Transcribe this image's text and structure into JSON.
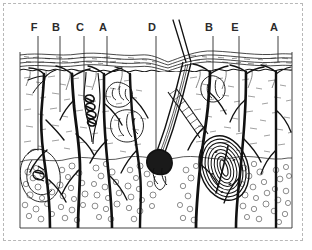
{
  "figure": {
    "frame_style": "dashed",
    "frame_color": "#b8b8b8",
    "ink_color": "#1a1a1a",
    "background_color": "#ffffff"
  },
  "labels": [
    {
      "id": "label-f-left",
      "text": "F",
      "x": 34,
      "y": 30,
      "leader_x": 38,
      "leader_top": 36,
      "leader_bottom": 150
    },
    {
      "id": "label-b-left",
      "text": "B",
      "x": 56,
      "y": 30,
      "leader_x": 60,
      "leader_top": 36,
      "leader_bottom": 112
    },
    {
      "id": "label-c-left",
      "text": "C",
      "x": 80,
      "y": 30,
      "leader_x": 84,
      "leader_top": 36,
      "leader_bottom": 100
    },
    {
      "id": "label-a-left",
      "text": "A",
      "x": 103,
      "y": 30,
      "leader_x": 107,
      "leader_top": 36,
      "leader_bottom": 66
    },
    {
      "id": "label-d-mid",
      "text": "D",
      "x": 152,
      "y": 30,
      "leader_x": 156,
      "leader_top": 36,
      "leader_bottom": 150
    },
    {
      "id": "label-b-right",
      "text": "B",
      "x": 209,
      "y": 30,
      "leader_x": 213,
      "leader_top": 36,
      "leader_bottom": 70
    },
    {
      "id": "label-e-right",
      "text": "E",
      "x": 235,
      "y": 30,
      "leader_x": 239,
      "leader_top": 36,
      "leader_bottom": 132
    },
    {
      "id": "label-a-right",
      "text": "A",
      "x": 274,
      "y": 30,
      "leader_x": 278,
      "leader_top": 36,
      "leader_bottom": 62
    }
  ],
  "layers": [
    {
      "name": "epidermis",
      "top": 52,
      "bottom": 70
    },
    {
      "name": "dermis",
      "top": 70,
      "bottom": 158
    },
    {
      "name": "hypodermis",
      "top": 158,
      "bottom": 228
    }
  ],
  "structures": [
    {
      "name": "hair-shaft",
      "description": "two parallel oblique lines rising above skin surface"
    },
    {
      "name": "hair-follicle",
      "description": "deep oblique follicle with dark root bulb"
    },
    {
      "name": "arrector-pili",
      "description": "hatched oblique muscle band"
    },
    {
      "name": "sweat-gland-coil",
      "description": "dark coiled gland in upper dermis"
    },
    {
      "name": "sebaceous-gland",
      "description": "lobed gland beside follicle"
    },
    {
      "name": "pacinian-corpuscle",
      "description": "onion-ring concentric lamellae in hypodermis"
    },
    {
      "name": "meissner-corpuscle",
      "description": "small oval receptor in dermal papilla"
    },
    {
      "name": "nerve-branches",
      "description": "thick black branching nerve trunks through dermis"
    },
    {
      "name": "adipose-lobules",
      "description": "bubbly fat cell clusters in hypodermis"
    }
  ]
}
